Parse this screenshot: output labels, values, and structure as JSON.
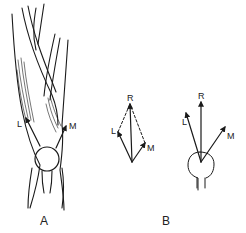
{
  "panels": [
    {
      "id": "A",
      "caption": "A",
      "description": "Anterior view of knee with quadriceps muscles and patella",
      "labels": {
        "lateral": "L",
        "medial": "M"
      }
    },
    {
      "id": "B",
      "caption": "B",
      "description": "Force vector diagrams",
      "vector_diagram_1": {
        "resultant": "R",
        "lateral": "L",
        "medial": "M"
      },
      "vector_diagram_2": {
        "resultant": "R",
        "lateral": "L",
        "medial": "M"
      }
    }
  ],
  "colors": {
    "line": "#1a1a1a",
    "background": "#ffffff"
  }
}
